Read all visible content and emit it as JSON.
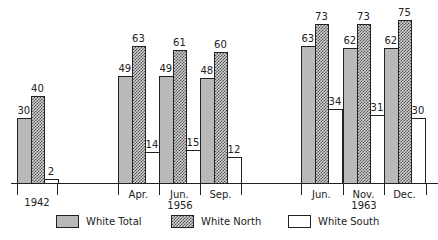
{
  "chart_data": {
    "type": "bar",
    "title": "",
    "xlabel": "",
    "ylabel": "",
    "ylim": [
      0,
      80
    ],
    "grid": false,
    "legend_position": "bottom",
    "categories": [
      "1942",
      "Apr. 1956",
      "Jun. 1956",
      "Sep. 1956",
      "Jun. 1963",
      "Nov. 1963",
      "Dec. 1963"
    ],
    "series": [
      {
        "name": "White Total",
        "values": [
          30,
          49,
          49,
          48,
          63,
          62,
          62
        ]
      },
      {
        "name": "White North",
        "values": [
          40,
          63,
          61,
          60,
          73,
          73,
          75
        ]
      },
      {
        "name": "White South",
        "values": [
          2,
          14,
          15,
          12,
          34,
          31,
          30
        ]
      }
    ],
    "x_tick_labels": [
      "Apr.",
      "Jun.",
      "Sep.",
      "Jun.",
      "Nov.",
      "Dec."
    ],
    "x_group_labels": [
      "1942",
      "1956",
      "1963"
    ]
  },
  "groups": [
    {
      "month": "",
      "x": 17,
      "values": [
        30,
        40,
        2
      ]
    },
    {
      "month": "Apr.",
      "x": 118,
      "values": [
        49,
        63,
        14
      ]
    },
    {
      "month": "Jun.",
      "x": 159,
      "values": [
        49,
        61,
        15
      ]
    },
    {
      "month": "Sep.",
      "x": 200,
      "values": [
        48,
        60,
        12
      ]
    },
    {
      "month": "Jun.",
      "x": 301,
      "values": [
        63,
        73,
        34
      ]
    },
    {
      "month": "Nov.",
      "x": 343,
      "values": [
        62,
        73,
        31
      ]
    },
    {
      "month": "Dec.",
      "x": 384,
      "values": [
        62,
        75,
        30
      ]
    }
  ],
  "year_labels": [
    {
      "text": "1942",
      "x": 37
    },
    {
      "text": "1956",
      "x": 180
    },
    {
      "text": "1963",
      "x": 364
    }
  ],
  "ticks": [
    17,
    57,
    118,
    159,
    200,
    241,
    301,
    343,
    384,
    426
  ],
  "legend": [
    {
      "label": "White Total",
      "class": "total",
      "x": 56
    },
    {
      "label": "White North",
      "class": "north",
      "x": 171
    },
    {
      "label": "White South",
      "class": "south",
      "x": 288
    }
  ],
  "colors": {
    "total": "#b9b9b9",
    "north_hatch": "#555555",
    "south": "#ffffff",
    "ink": "#222222"
  },
  "scale": {
    "axis_y": 183,
    "px_per_unit": 2.18
  }
}
